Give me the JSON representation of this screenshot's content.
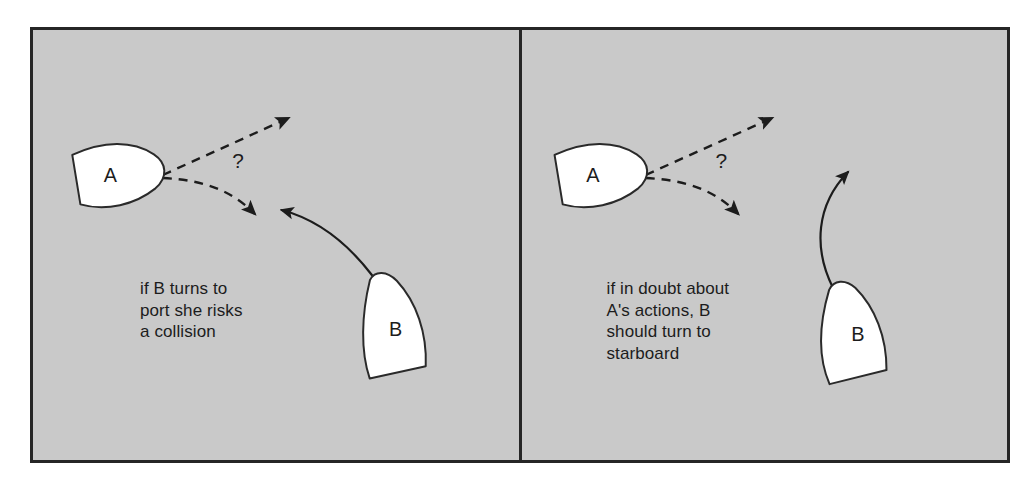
{
  "figure": {
    "background_color": "#ffffff",
    "panel_fill": "#c9c9c9",
    "panel_border_color": "#262626",
    "ink_color": "#1c1c1c",
    "hull_fill": "#ffffff"
  },
  "panels": [
    {
      "id": "left",
      "name": "risk-of-collision-panel",
      "caption": "if B turns to\nport she risks\na collision",
      "vessels": [
        {
          "id": "A",
          "label": "A",
          "heading": "east-northeast",
          "position": "upper-left"
        },
        {
          "id": "B",
          "label": "B",
          "heading": "north-northwest",
          "position": "lower-right"
        }
      ],
      "annotations": [
        {
          "type": "question-mark",
          "label": "?"
        },
        {
          "type": "dashed-straight-arrow",
          "meaning": "vessel A possible course: hold on / turn to starboard"
        },
        {
          "type": "dashed-curved-arrow",
          "meaning": "vessel A possible course: turn to starboard toward B"
        },
        {
          "type": "solid-curved-arrow",
          "meaning": "vessel B turns to port"
        }
      ]
    },
    {
      "id": "right",
      "name": "turn-to-starboard-panel",
      "caption": "if in doubt about\nA's actions, B\nshould turn to\nstarboard",
      "vessels": [
        {
          "id": "A",
          "label": "A",
          "heading": "east-northeast",
          "position": "upper-left"
        },
        {
          "id": "B",
          "label": "B",
          "heading": "north",
          "position": "lower-right"
        }
      ],
      "annotations": [
        {
          "type": "question-mark",
          "label": "?"
        },
        {
          "type": "dashed-straight-arrow",
          "meaning": "vessel A possible course: hold on / turn to starboard"
        },
        {
          "type": "dashed-curved-arrow",
          "meaning": "vessel A possible course: turn to starboard"
        },
        {
          "type": "solid-curved-arrow",
          "meaning": "vessel B turns to starboard"
        }
      ]
    }
  ]
}
